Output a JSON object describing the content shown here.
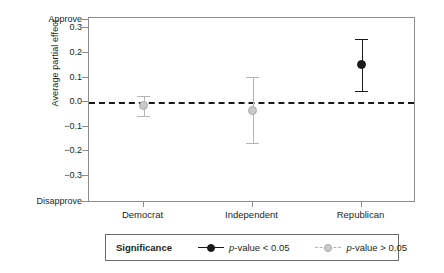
{
  "chart_data": {
    "type": "scatter",
    "title": "",
    "subtitle": "",
    "xlabel": "",
    "ylabel": "Average partial effect",
    "categories": [
      "Democrat",
      "Independent",
      "Republican"
    ],
    "ylim": [
      -0.3,
      0.3
    ],
    "yticks": [
      0.3,
      0.2,
      0.1,
      0.0,
      -0.1,
      -0.2,
      -0.3
    ],
    "ytick_labels": [
      "0.3",
      "0.2",
      "0.1",
      "0.0",
      "−0.1",
      "−0.2",
      "−0.3"
    ],
    "y_axis_top_label": "Approve",
    "y_axis_bottom_label": "Disapprove",
    "grid": false,
    "reference_line": {
      "value": 0.0,
      "style": "dashed",
      "color": "#1a1a1a"
    },
    "legend_position": "bottom",
    "points": [
      {
        "category": "Democrat",
        "estimate": -0.013,
        "ci_low": -0.057,
        "ci_high": 0.025,
        "significant": false,
        "color": "#c9c9c9"
      },
      {
        "category": "Independent",
        "estimate": -0.033,
        "ci_low": -0.167,
        "ci_high": 0.103,
        "significant": false,
        "color": "#c9c9c9"
      },
      {
        "category": "Republican",
        "estimate": 0.152,
        "ci_low": 0.047,
        "ci_high": 0.255,
        "significant": true,
        "color": "#1a1a1a"
      }
    ],
    "series": [
      {
        "name": "p-value < 0.05",
        "values": [
          null,
          null,
          0.152
        ]
      },
      {
        "name": "p-value > 0.05",
        "values": [
          -0.013,
          -0.033,
          null
        ]
      }
    ]
  },
  "legend": {
    "title": "Significance",
    "items": [
      {
        "label_italic": "p",
        "label_rest": "-value < 0.05",
        "significant": true
      },
      {
        "label_italic": "p",
        "label_rest": "-value > 0.05",
        "significant": false
      }
    ]
  },
  "colors": {
    "significant": "#1a1a1a",
    "nonsignificant": "#c9c9c9",
    "axis": "#8d8d8d",
    "text": "#231f20"
  }
}
